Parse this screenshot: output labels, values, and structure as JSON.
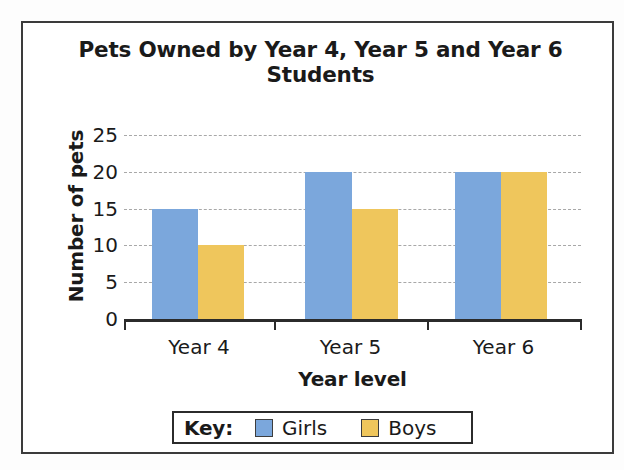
{
  "chart_data": {
    "type": "bar",
    "title": "Pets Owned by Year 4, Year 5 and Year 6 Students",
    "title_line1": "Pets Owned by Year 4, Year 5 and Year 6",
    "title_line2": "Students",
    "xlabel": "Year level",
    "ylabel": "Number of pets",
    "categories": [
      "Year 4",
      "Year 5",
      "Year 6"
    ],
    "series": [
      {
        "name": "Girls",
        "color": "#7ba7dc",
        "values": [
          15,
          20,
          20
        ]
      },
      {
        "name": "Boys",
        "color": "#efc65c",
        "values": [
          10,
          15,
          20
        ]
      }
    ],
    "ylim": [
      0,
      25
    ],
    "ytick_labels": [
      "0",
      "5",
      "10",
      "15",
      "20",
      "25"
    ],
    "ytick_values": [
      0,
      5,
      10,
      15,
      20,
      25
    ],
    "grid": true,
    "grid_style": "dashed",
    "legend_position": "bottom"
  },
  "legend": {
    "key_label": "Key:",
    "entries": [
      {
        "label": "Girls",
        "color": "#7ba7dc"
      },
      {
        "label": "Boys",
        "color": "#efc65c"
      }
    ]
  }
}
